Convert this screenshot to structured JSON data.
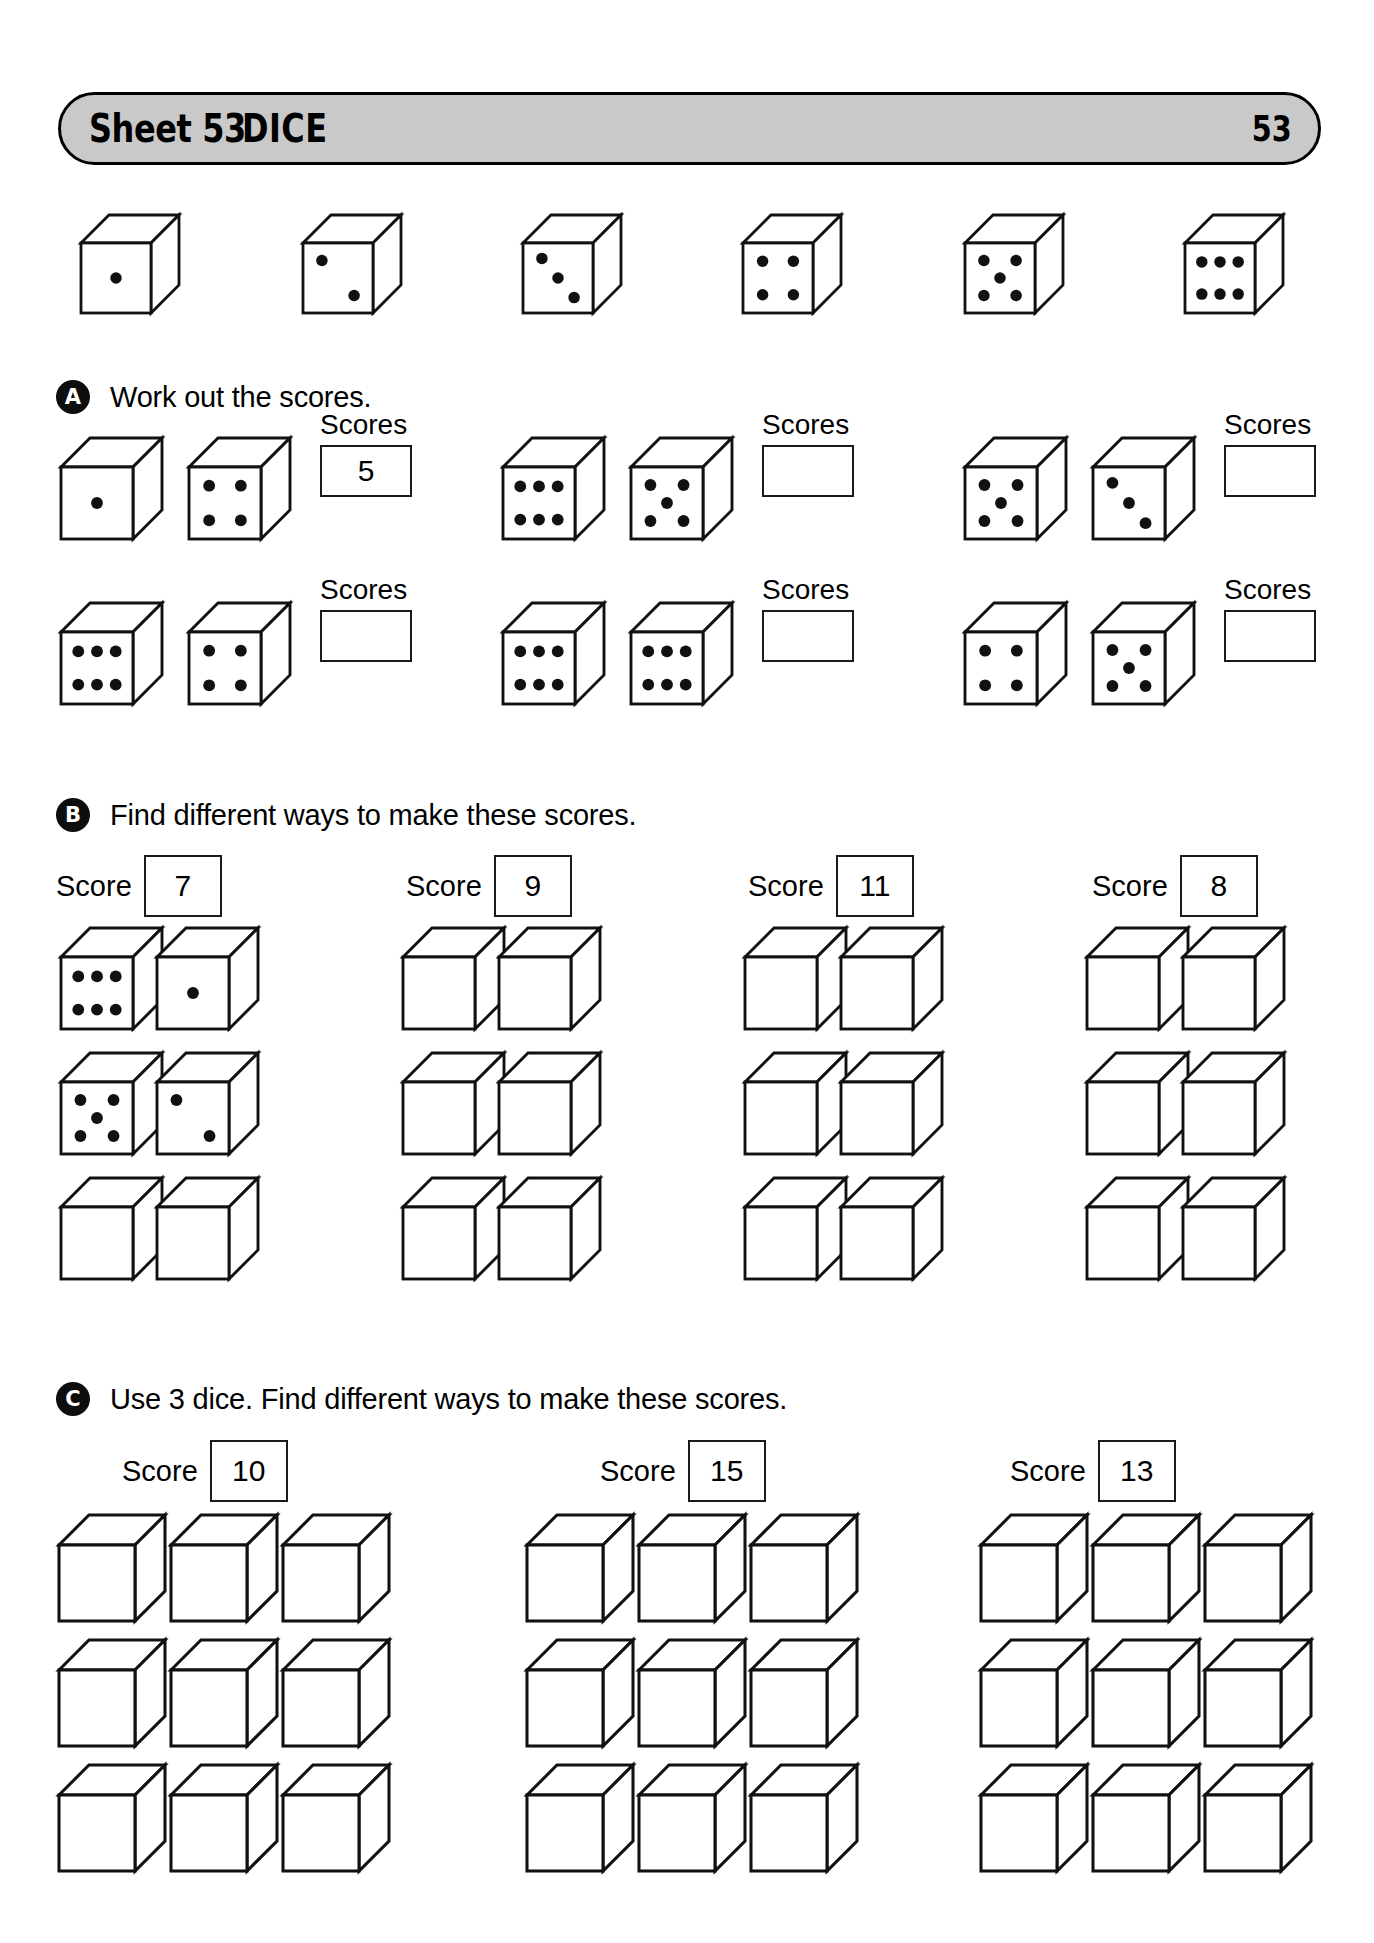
{
  "header": {
    "sheet_label": "Sheet 53",
    "title": "DICE",
    "page_number": "53",
    "bar_color": "#c9c9c9"
  },
  "reference_row": {
    "name": "dice-key-row",
    "dice": [
      1,
      2,
      3,
      4,
      5,
      6
    ]
  },
  "section_a": {
    "marker": "A",
    "instruction": "Work out the scores.",
    "scores_label": "Scores",
    "items": [
      {
        "dice": [
          1,
          4
        ],
        "answer": "5"
      },
      {
        "dice": [
          6,
          5
        ],
        "answer": ""
      },
      {
        "dice": [
          5,
          3
        ],
        "answer": ""
      },
      {
        "dice": [
          6,
          4
        ],
        "answer": ""
      },
      {
        "dice": [
          6,
          6
        ],
        "answer": ""
      },
      {
        "dice": [
          4,
          5
        ],
        "answer": ""
      }
    ]
  },
  "section_b": {
    "marker": "B",
    "instruction": "Find different ways to make these scores.",
    "score_label": "Score",
    "columns": [
      {
        "score": "7",
        "rows": [
          {
            "dice": [
              6,
              1
            ]
          },
          {
            "dice": [
              5,
              2
            ]
          },
          {
            "dice": [
              0,
              0
            ]
          }
        ]
      },
      {
        "score": "9",
        "rows": [
          {
            "dice": [
              0,
              0
            ]
          },
          {
            "dice": [
              0,
              0
            ]
          },
          {
            "dice": [
              0,
              0
            ]
          }
        ]
      },
      {
        "score": "11",
        "rows": [
          {
            "dice": [
              0,
              0
            ]
          },
          {
            "dice": [
              0,
              0
            ]
          },
          {
            "dice": [
              0,
              0
            ]
          }
        ]
      },
      {
        "score": "8",
        "rows": [
          {
            "dice": [
              0,
              0
            ]
          },
          {
            "dice": [
              0,
              0
            ]
          },
          {
            "dice": [
              0,
              0
            ]
          }
        ]
      }
    ]
  },
  "section_c": {
    "marker": "C",
    "instruction": "Use 3 dice. Find different ways to make these scores.",
    "score_label": "Score",
    "columns": [
      {
        "score": "10",
        "rows": [
          {
            "dice": [
              0,
              0,
              0
            ]
          },
          {
            "dice": [
              0,
              0,
              0
            ]
          },
          {
            "dice": [
              0,
              0,
              0
            ]
          }
        ]
      },
      {
        "score": "15",
        "rows": [
          {
            "dice": [
              0,
              0,
              0
            ]
          },
          {
            "dice": [
              0,
              0,
              0
            ]
          },
          {
            "dice": [
              0,
              0,
              0
            ]
          }
        ]
      },
      {
        "score": "13",
        "rows": [
          {
            "dice": [
              0,
              0,
              0
            ]
          },
          {
            "dice": [
              0,
              0,
              0
            ]
          },
          {
            "dice": [
              0,
              0,
              0
            ]
          }
        ]
      }
    ]
  }
}
